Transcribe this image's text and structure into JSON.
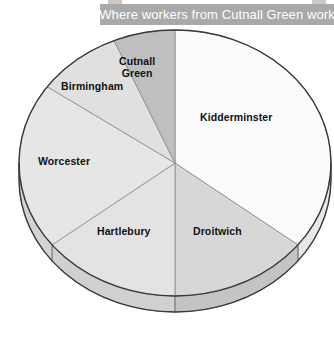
{
  "title": {
    "text": "Where workers from Cutnall Green work"
  },
  "chart_data": {
    "type": "pie",
    "title": "Where workers from Cutnall Green work",
    "xlabel": "",
    "ylabel": "",
    "legend": "none",
    "grid": false,
    "style": "3d-pie",
    "start_angle_deg": 0,
    "direction": "clockwise",
    "labels": [
      "Kidderminster",
      "Droitwich",
      "Hartlebury",
      "Worcester",
      "Birmingham",
      "Cutnall Green"
    ],
    "values": [
      35.5,
      14.5,
      14.5,
      20.0,
      9.0,
      6.5
    ],
    "unit": "percent",
    "slices": [
      {
        "label": "Kidderminster",
        "value": 35.5,
        "start_deg": 0,
        "end_deg": 128,
        "color": "#fbfbfb",
        "side_color": "#e8e8e8",
        "label_x": 200,
        "label_y": 111
      },
      {
        "label": "Droitwich",
        "value": 14.5,
        "start_deg": 128,
        "end_deg": 180,
        "color": "#d7d7d7",
        "side_color": "#c4c4c4",
        "label_x": 193,
        "label_y": 225
      },
      {
        "label": "Hartlebury",
        "value": 14.5,
        "start_deg": 180,
        "end_deg": 232,
        "color": "#e3e3e3",
        "side_color": "#d0d0d0",
        "label_x": 97,
        "label_y": 225
      },
      {
        "label": "Worcester",
        "value": 20.0,
        "start_deg": 232,
        "end_deg": 305,
        "color": "#e6e6e6",
        "side_color": "#d3d3d3",
        "label_x": 38,
        "label_y": 155
      },
      {
        "label": "Birmingham",
        "value": 9.0,
        "start_deg": 305,
        "end_deg": 337,
        "color": "#e0e0e0",
        "side_color": "#cdcdcd",
        "label_x": 61,
        "label_y": 80
      },
      {
        "label": "Cutnall Green",
        "value": 6.5,
        "start_deg": 337,
        "end_deg": 360,
        "color": "#bfbfbf",
        "side_color": "#ababab",
        "label_line1": "Cutnall",
        "label_line2": "Green",
        "label_x": 119,
        "label_y": 55
      }
    ],
    "geometry": {
      "center_x": 175,
      "center_y": 163,
      "radius_x": 156,
      "radius_y": 133,
      "depth": 16
    },
    "colors": {
      "outline": "#3a3a3a",
      "divider": "#8a8a8a",
      "banner": "#a9a9a9",
      "banner_text": "#ffffff",
      "label_text": "#111111"
    }
  }
}
